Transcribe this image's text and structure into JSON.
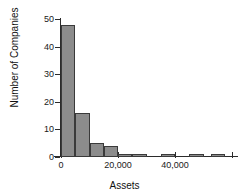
{
  "chart_data": {
    "type": "bar",
    "title": "",
    "xlabel": "Assets",
    "ylabel": "Number of Companies",
    "xlim": [
      0,
      60000
    ],
    "ylim": [
      0,
      50
    ],
    "grid": false,
    "legend": false,
    "bin_width": 5000,
    "bin_edges": [
      0,
      5000,
      10000,
      15000,
      20000,
      25000,
      30000,
      35000,
      40000,
      45000,
      50000,
      55000,
      60000
    ],
    "categories": [
      "0-5,000",
      "5,000-10,000",
      "10,000-15,000",
      "15,000-20,000",
      "20,000-25,000",
      "25,000-30,000",
      "30,000-35,000",
      "35,000-40,000",
      "40,000-45,000",
      "45,000-50,000",
      "50,000-55,000",
      "55,000-60,000"
    ],
    "values": [
      48,
      16,
      5,
      4,
      1,
      1,
      0,
      1,
      0,
      1,
      1,
      0
    ],
    "bars": [
      {
        "x0": 0,
        "x1": 5000,
        "value": 48
      },
      {
        "x0": 5000,
        "x1": 10000,
        "value": 16
      },
      {
        "x0": 10000,
        "x1": 15000,
        "value": 5
      },
      {
        "x0": 15000,
        "x1": 20000,
        "value": 4
      },
      {
        "x0": 20000,
        "x1": 25000,
        "value": 1
      },
      {
        "x0": 25000,
        "x1": 30000,
        "value": 1
      },
      {
        "x0": 35000,
        "x1": 40000,
        "value": 1
      },
      {
        "x0": 45000,
        "x1": 50000,
        "value": 1
      },
      {
        "x0": 52500,
        "x1": 57500,
        "value": 1
      }
    ],
    "x_ticks": [
      {
        "value": 0,
        "label": "0"
      },
      {
        "value": 20000,
        "label": "20,000"
      },
      {
        "value": 40000,
        "label": "40,000"
      },
      {
        "value": 60000,
        "label": ""
      }
    ],
    "y_ticks": [
      {
        "value": 0,
        "label": "0"
      },
      {
        "value": 10,
        "label": "10"
      },
      {
        "value": 20,
        "label": "20"
      },
      {
        "value": 30,
        "label": "30"
      },
      {
        "value": 40,
        "label": "40"
      },
      {
        "value": 50,
        "label": "50"
      }
    ],
    "colors": {
      "bar_fill": "#8c8c8c",
      "bar_edge": "#3a3a3a",
      "axis": "#2b2b2b",
      "text": "#111111",
      "background": "#ffffff"
    }
  }
}
